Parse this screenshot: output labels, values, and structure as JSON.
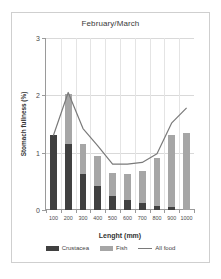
{
  "chart_data": {
    "type": "bar",
    "title": "February/March",
    "xlabel": "Lenght (mm)",
    "ylabel": "Stomach fullness (%)",
    "categories": [
      "100",
      "200",
      "300",
      "400",
      "500",
      "600",
      "700",
      "800",
      "900",
      "1000"
    ],
    "ylim": [
      0,
      3
    ],
    "yticks": [
      0,
      1,
      2,
      3
    ],
    "ytick_labels": [
      "0",
      "1",
      "2",
      "3"
    ],
    "grid": true,
    "legend_position": "bottom",
    "stacked": true,
    "series": [
      {
        "name": "Crustacea",
        "type": "bar",
        "color": "#404040",
        "values": [
          1.3,
          1.15,
          0.62,
          0.42,
          0.25,
          0.17,
          0.12,
          0.07,
          0.05,
          0.0
        ]
      },
      {
        "name": "Fish",
        "type": "bar",
        "color": "#a6a6a6",
        "values": [
          0.0,
          0.88,
          0.53,
          0.53,
          0.39,
          0.46,
          0.56,
          0.83,
          1.25,
          1.35
        ]
      },
      {
        "name": "All food",
        "type": "line",
        "color": "#7a7a7a",
        "values": [
          1.3,
          2.05,
          1.42,
          1.12,
          0.8,
          0.8,
          0.83,
          0.98,
          1.52,
          1.78
        ]
      }
    ]
  }
}
